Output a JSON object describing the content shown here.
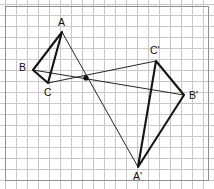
{
  "figure": {
    "width": 214,
    "height": 189,
    "background_color": "#ffffff",
    "grid": {
      "visible": true,
      "cell_size": 11,
      "color": "#c8c8cc",
      "origin_x": 5,
      "origin_y": 4
    },
    "frame": {
      "visible": true,
      "color": "#8e8e96",
      "x": 5,
      "y": 6,
      "width": 203,
      "height": 174
    },
    "style": {
      "edge_color": "#151515",
      "edge_width": 2.1,
      "connector_color": "#252525",
      "connector_width": 1,
      "label_color": "#101010",
      "label_size": 10.5
    },
    "center": {
      "label": "",
      "x": 86,
      "y": 78,
      "radius": 2.6,
      "marked": true
    },
    "vertices": [
      {
        "name": "A",
        "label": "A",
        "x": 62,
        "y": 32,
        "label_x": 58,
        "label_y": 26
      },
      {
        "name": "B",
        "label": "B",
        "x": 33,
        "y": 70,
        "label_x": 19,
        "label_y": 71
      },
      {
        "name": "C",
        "label": "C",
        "x": 48,
        "y": 83,
        "label_x": 44,
        "label_y": 96
      },
      {
        "name": "A'",
        "label": "A'",
        "x": 138,
        "y": 167,
        "label_x": 133,
        "label_y": 180
      },
      {
        "name": "B'",
        "label": "B'",
        "x": 184,
        "y": 95,
        "label_x": 189,
        "label_y": 99
      },
      {
        "name": "C'",
        "label": "C'",
        "x": 156,
        "y": 61,
        "label_x": 150,
        "label_y": 54
      }
    ],
    "triangles": [
      {
        "name": "triangle-abc",
        "vertices": [
          "A",
          "B",
          "C"
        ]
      },
      {
        "name": "triangle-a-prime",
        "vertices": [
          "A'",
          "B'",
          "C'"
        ]
      }
    ],
    "connectors": [
      {
        "name": "connector-a",
        "from": "A",
        "to": "A'"
      },
      {
        "name": "connector-b",
        "from": "B",
        "to": "B'"
      },
      {
        "name": "connector-c",
        "from": "C",
        "to": "C'"
      }
    ]
  }
}
